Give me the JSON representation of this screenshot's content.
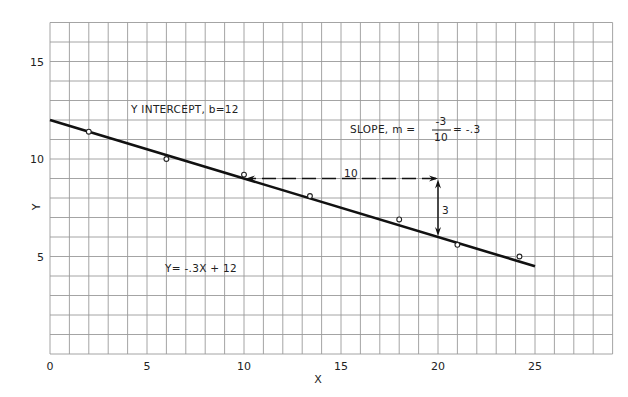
{
  "chart_data": {
    "type": "scatter",
    "title": "",
    "xlabel": "X",
    "ylabel": "Y",
    "xlim": [
      0,
      29
    ],
    "ylim": [
      0,
      17
    ],
    "grid": true,
    "x_ticks": [
      0,
      5,
      10,
      15,
      20,
      25
    ],
    "y_ticks": [
      5,
      10,
      15
    ],
    "series": [
      {
        "name": "observations",
        "kind": "scatter",
        "marker": "open-circle",
        "points": [
          [
            2,
            11.4
          ],
          [
            6,
            10.0
          ],
          [
            10,
            9.2
          ],
          [
            13.4,
            8.1
          ],
          [
            18,
            6.9
          ],
          [
            21,
            5.6
          ],
          [
            24.2,
            5.0
          ]
        ]
      },
      {
        "name": "fitted line Y = -.3X + 12",
        "kind": "line",
        "points": [
          [
            0,
            12
          ],
          [
            25,
            4.5
          ]
        ]
      }
    ],
    "annotations": {
      "intercept": "Y INTERCEPT, b=12",
      "slope_prefix": "SLOPE,  m =",
      "slope_num": "-3",
      "slope_den": "10",
      "slope_suffix": "= -.3",
      "equation": "Y= -.3X + 12",
      "run_label": "10",
      "rise_label": "3",
      "run_arrow": {
        "from": [
          20,
          9
        ],
        "to": [
          10,
          9
        ]
      },
      "rise_arrow": {
        "from": [
          20,
          9
        ],
        "to": [
          20,
          6
        ]
      }
    }
  }
}
